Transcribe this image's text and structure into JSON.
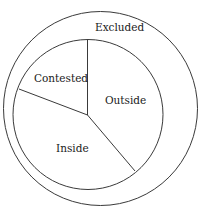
{
  "diagram": {
    "type": "nested-circle-sectors",
    "outer_region": {
      "label": "Excluded"
    },
    "inner_sectors": [
      {
        "label": "Contested"
      },
      {
        "label": "Outside"
      },
      {
        "label": "Inside"
      }
    ],
    "colors": {
      "stroke": "#3a3a3a",
      "text": "#1a1a1a",
      "background": "#ffffff"
    }
  }
}
